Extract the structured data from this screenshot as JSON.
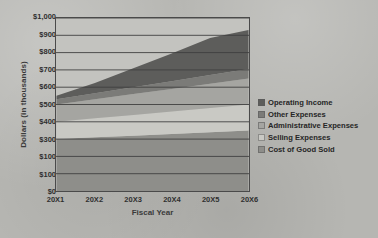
{
  "chart_data": {
    "type": "area",
    "stacked": true,
    "title": "",
    "xlabel": "Fiscal Year",
    "ylabel": "Dollars (in thousands)",
    "categories": [
      "20X1",
      "20X2",
      "20X3",
      "20X4",
      "20X5",
      "20X6"
    ],
    "x_tick_labels": [
      "20X1",
      "20X2",
      "20X3",
      "20X4",
      "20X5",
      "20X6"
    ],
    "y_tick_labels": [
      "$1,000",
      "$900",
      "$800",
      "$700",
      "$600",
      "$500",
      "$400",
      "$300",
      "$100",
      "$100",
      "$0"
    ],
    "y_tick_values": [
      1000,
      900,
      800,
      700,
      600,
      500,
      400,
      300,
      200,
      100,
      0
    ],
    "ylim": [
      0,
      1000
    ],
    "y_step": 100,
    "grid": true,
    "legend_position": "right",
    "series": [
      {
        "name": "Cost of Good Sold",
        "color": "#8e8e8a",
        "values": [
          300,
          310,
          320,
          330,
          340,
          350
        ]
      },
      {
        "name": "Selling Expenses",
        "color": "#c9c9c4",
        "values": [
          100,
          110,
          120,
          130,
          140,
          150
        ]
      },
      {
        "name": "Administrative Expenses",
        "color": "#a5a5a1",
        "values": [
          100,
          110,
          120,
          130,
          140,
          150
        ]
      },
      {
        "name": "Other Expenses",
        "color": "#7b7b78",
        "values": [
          30,
          35,
          40,
          45,
          50,
          55
        ]
      },
      {
        "name": "Operating Income",
        "color": "#5d5d5b",
        "values": [
          20,
          60,
          110,
          160,
          215,
          225
        ]
      }
    ],
    "cumulative_totals": [
      550,
      625,
      710,
      795,
      885,
      930
    ]
  },
  "legend": {
    "items": [
      {
        "label": "Operating Income",
        "color": "#5d5d5b"
      },
      {
        "label": "Other Expenses",
        "color": "#7b7b78"
      },
      {
        "label": "Administrative Expenses",
        "color": "#a5a5a1"
      },
      {
        "label": "Selling Expenses",
        "color": "#c9c9c4"
      },
      {
        "label": "Cost of Good Sold",
        "color": "#8e8e8a"
      }
    ]
  }
}
